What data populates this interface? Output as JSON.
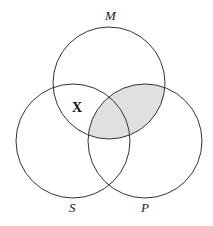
{
  "diagram": {
    "type": "venn-3",
    "circles": [
      {
        "label": "M",
        "cx": 109,
        "cy": 83,
        "r": 56
      },
      {
        "label": "S",
        "cx": 73,
        "cy": 141,
        "r": 57
      },
      {
        "label": "P",
        "cx": 145,
        "cy": 141,
        "r": 57
      }
    ],
    "shaded_region": "M ∩ P",
    "shade_color": "#e0e0e0",
    "marker": {
      "text": "X",
      "region": "M ∩ S, outside P"
    },
    "labels": {
      "M": "M",
      "S": "S",
      "P": "P"
    }
  }
}
